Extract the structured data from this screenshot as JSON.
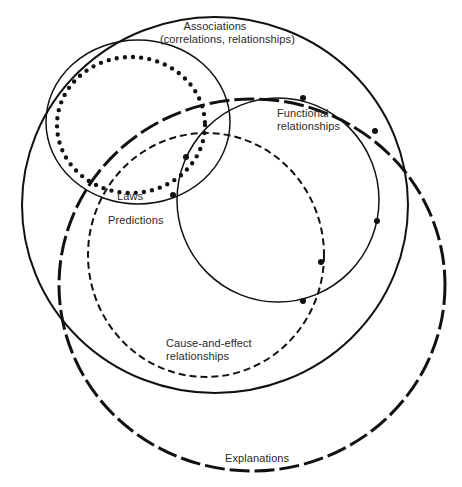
{
  "diagram": {
    "stroke_color": "#111111",
    "text_color": "#2a2a2a",
    "background": "#ffffff",
    "sets": [
      {
        "id": "associations",
        "label_line1": "Associations",
        "label_line2": "(correlations, relationships)",
        "line_style": "solid",
        "cx": 215,
        "cy": 205,
        "rx": 193,
        "ry": 188
      },
      {
        "id": "explanations",
        "label_line1": "Explanations",
        "line_style": "long-dash",
        "cx": 252,
        "cy": 285,
        "rx": 193,
        "ry": 186
      },
      {
        "id": "laws",
        "label_line1": "Laws",
        "line_style": "solid-thin",
        "cx": 138,
        "cy": 122,
        "rx": 92,
        "ry": 82
      },
      {
        "id": "predictions",
        "label_line1": "Predictions",
        "line_style": "dotted",
        "cx": 131,
        "cy": 125,
        "rx": 74,
        "ry": 68
      },
      {
        "id": "functional",
        "label_line1": "Functional",
        "label_line2": "relationships",
        "line_style": "solid-thin-with-dots",
        "cx": 278,
        "cy": 200,
        "rx": 101,
        "ry": 102
      },
      {
        "id": "cause-effect",
        "label_line1": "Cause-and-effect",
        "label_line2": "relationships",
        "line_style": "short-dash",
        "cx": 206,
        "cy": 255,
        "rx": 118,
        "ry": 122
      }
    ],
    "functional_dots": [
      [
        303,
        98
      ],
      [
        375,
        131
      ],
      [
        377,
        221
      ],
      [
        321,
        262
      ],
      [
        303,
        301
      ],
      [
        186,
        157
      ],
      [
        173,
        195
      ]
    ]
  }
}
